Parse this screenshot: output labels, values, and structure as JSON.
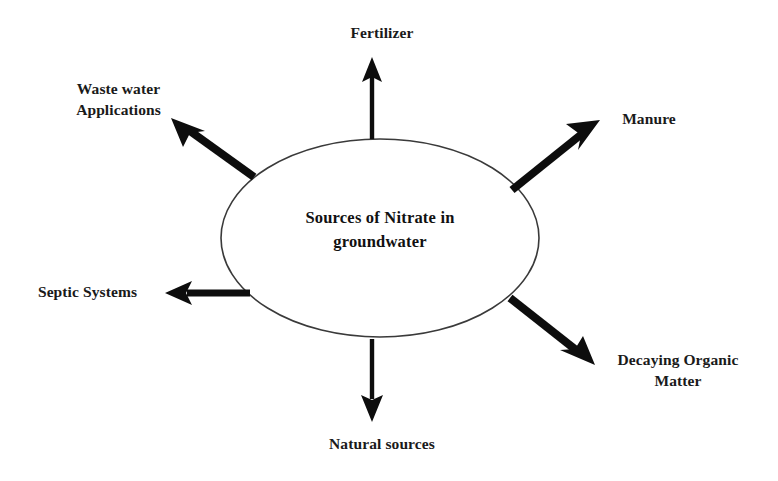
{
  "diagram": {
    "type": "radial-concept-map",
    "center": {
      "text": "Sources of Nitrate in\ngroundwater",
      "shape": "ellipse",
      "stroke_color": "#3a3a3a",
      "fill_color": "#ffffff"
    },
    "arrow_color": "#0d0d0d",
    "background_color": "#ffffff",
    "text_color": "#1a1a1a",
    "nodes": [
      {
        "id": "fertilizer",
        "label": "Fertilizer",
        "direction": "up",
        "arrow": "thin"
      },
      {
        "id": "waste-water-applications",
        "label": "Waste water\nApplications",
        "direction": "up-left",
        "arrow": "thick"
      },
      {
        "id": "manure",
        "label": "Manure",
        "direction": "up-right",
        "arrow": "thick"
      },
      {
        "id": "septic-systems",
        "label": "Septic Systems",
        "direction": "left",
        "arrow": "medium"
      },
      {
        "id": "decaying-organic-matter",
        "label": "Decaying Organic\nMatter",
        "direction": "down-right",
        "arrow": "thick"
      },
      {
        "id": "natural-sources",
        "label": "Natural sources",
        "direction": "down",
        "arrow": "thin"
      }
    ]
  }
}
